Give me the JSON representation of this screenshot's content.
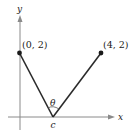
{
  "diagram": {
    "axes": {
      "x_label": "x",
      "y_label": "y",
      "axis_color": "#8a8a8a"
    },
    "points": [
      {
        "label": "(0, 2)",
        "coord": [
          0,
          2
        ]
      },
      {
        "label": "(4, 2)",
        "coord": [
          4,
          2
        ]
      }
    ],
    "vertex_label": "c",
    "angle_label": "θ",
    "line_color": "#2a2a2a"
  }
}
